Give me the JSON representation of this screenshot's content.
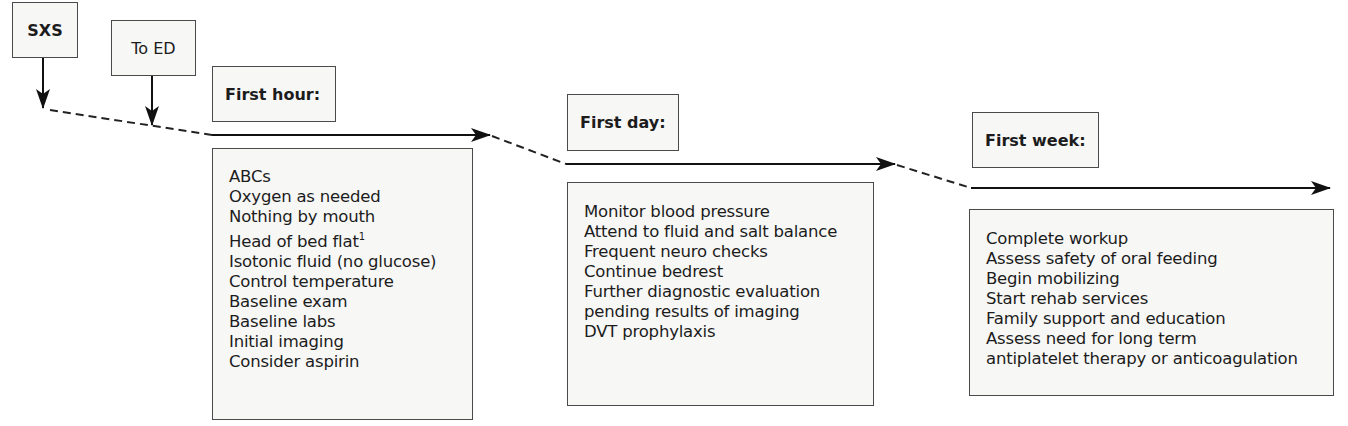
{
  "events": [
    {
      "id": "sxs",
      "label": "SXS"
    },
    {
      "id": "to-ed",
      "label": "To ED"
    }
  ],
  "phases": [
    {
      "id": "first-hour",
      "label": "First hour:",
      "items": [
        "ABCs",
        "Oxygen as needed",
        "Nothing by mouth",
        "Head of bed flat",
        "Isotonic fluid (no glucose)",
        "Control temperature",
        "Baseline exam",
        "Baseline labs",
        "Initial imaging",
        "Consider aspirin"
      ],
      "footnote_marker": "1"
    },
    {
      "id": "first-day",
      "label": "First day:",
      "items": [
        "Monitor blood pressure",
        "Attend to fluid and salt balance",
        "Frequent neuro checks",
        "Continue bedrest",
        "Further diagnostic evaluation",
        "pending results of imaging",
        "DVT prophylaxis"
      ]
    },
    {
      "id": "first-week",
      "label": "First week:",
      "items": [
        "Complete workup",
        "Assess safety of oral feeding",
        "Begin mobilizing",
        "Start rehab services",
        "Family support and education",
        "Assess need for long term",
        "antiplatelet therapy or anticoagulation"
      ]
    }
  ],
  "colors": {
    "line": "#111111",
    "box_border": "#4a4a4a",
    "box_fill": "#f7f7f6"
  }
}
